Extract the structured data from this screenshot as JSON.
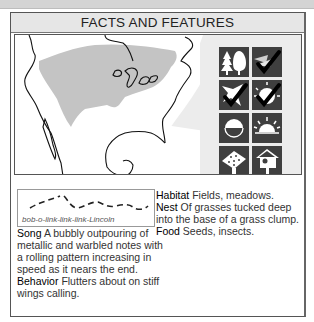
{
  "header": {
    "title": "FACTS AND FEATURES"
  },
  "map": {
    "description": "range-map-north-america",
    "range_color": "#c4c4c4"
  },
  "icons": [
    {
      "name": "forest-icon",
      "checked": false
    },
    {
      "name": "grassland-icon",
      "checked": true
    },
    {
      "name": "flight-icon",
      "checked": true
    },
    {
      "name": "sun-icon",
      "checked": true
    },
    {
      "name": "moon-icon",
      "checked": false
    },
    {
      "name": "sunrise-icon",
      "checked": false
    },
    {
      "name": "feeder-icon",
      "checked": false
    },
    {
      "name": "birdhouse-icon",
      "checked": false
    }
  ],
  "song": {
    "phonetic": "bob-o-link-link-link-Lincoln",
    "label": "Song",
    "text": "A bubbly outpouring of metallic and warbled notes with a rolling pattern increasing in speed as it nears the end."
  },
  "behavior": {
    "label": "Behavior",
    "text": "Flutters about on stiff wings calling."
  },
  "habitat": {
    "label": "Habitat",
    "text": "Fields, meadows."
  },
  "nest": {
    "label": "Nest",
    "text": "Of grasses tucked deep into the base of a grass clump."
  },
  "food": {
    "label": "Food",
    "text": "Seeds, insects."
  }
}
